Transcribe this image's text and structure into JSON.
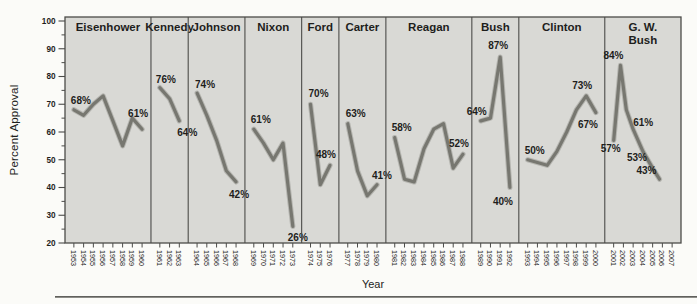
{
  "chart_data": {
    "type": "line",
    "xlabel": "Year",
    "ylabel": "Percent Approval",
    "ylim": [
      20,
      100
    ],
    "y_major_step": 10,
    "y_minor_step": 5,
    "x_range": [
      1953,
      2007
    ],
    "grid": false,
    "legend": "none",
    "line_color": "#74746d",
    "line_halo_color": "#8a8a83",
    "plot_bg": "#d9d9d5",
    "frame_color": "#4c4c49",
    "text_color": "#1e1e1c",
    "panels": [
      {
        "president": "Eisenhower",
        "title_lines": [
          "Eisenhower"
        ],
        "years": [
          1953,
          1960
        ],
        "points": [
          [
            1953,
            68
          ],
          [
            1954,
            66
          ],
          [
            1955,
            70
          ],
          [
            1956,
            73
          ],
          [
            1957,
            64
          ],
          [
            1958,
            55
          ],
          [
            1959,
            65
          ],
          [
            1960,
            61
          ]
        ],
        "callouts": [
          {
            "text": "68%",
            "anchor": [
              1953,
              68
            ],
            "dx": 7,
            "dy": -9
          },
          {
            "text": "61%",
            "anchor": [
              1960,
              61
            ],
            "dx": -4,
            "dy": -15
          }
        ]
      },
      {
        "president": "Kennedy",
        "title_lines": [
          "Kennedy"
        ],
        "years": [
          1961,
          1963
        ],
        "points": [
          [
            1961,
            76
          ],
          [
            1962,
            72
          ],
          [
            1963,
            64
          ]
        ],
        "callouts": [
          {
            "text": "76%",
            "anchor": [
              1961,
              76
            ],
            "dx": 6,
            "dy": -8
          },
          {
            "text": "64%",
            "anchor": [
              1963,
              64
            ],
            "dx": 8,
            "dy": 12
          }
        ]
      },
      {
        "president": "Johnson",
        "title_lines": [
          "Johnson"
        ],
        "years": [
          1964,
          1968
        ],
        "points": [
          [
            1964,
            74
          ],
          [
            1965,
            66
          ],
          [
            1966,
            57
          ],
          [
            1967,
            46
          ],
          [
            1968,
            42
          ]
        ],
        "callouts": [
          {
            "text": "74%",
            "anchor": [
              1964,
              74
            ],
            "dx": 8,
            "dy": -8
          },
          {
            "text": "42%",
            "anchor": [
              1968,
              42
            ],
            "dx": 3,
            "dy": 13
          }
        ]
      },
      {
        "president": "Nixon",
        "title_lines": [
          "Nixon"
        ],
        "years": [
          1969,
          1973
        ],
        "points": [
          [
            1969,
            61
          ],
          [
            1970,
            56
          ],
          [
            1971,
            50
          ],
          [
            1972,
            56
          ],
          [
            1973,
            26
          ]
        ],
        "callouts": [
          {
            "text": "61%",
            "anchor": [
              1969,
              61
            ],
            "dx": 7,
            "dy": -9
          },
          {
            "text": "26%",
            "anchor": [
              1973,
              26
            ],
            "dx": 5,
            "dy": 12
          }
        ]
      },
      {
        "president": "Ford",
        "title_lines": [
          "Ford"
        ],
        "years": [
          1974,
          1976
        ],
        "points": [
          [
            1974,
            70
          ],
          [
            1975,
            41
          ],
          [
            1976,
            48
          ]
        ],
        "callouts": [
          {
            "text": "70%",
            "anchor": [
              1974,
              70
            ],
            "dx": 8,
            "dy": -10
          },
          {
            "text": "48%",
            "anchor": [
              1976,
              48
            ],
            "dx": -4,
            "dy": -10
          }
        ]
      },
      {
        "president": "Carter",
        "title_lines": [
          "Carter"
        ],
        "years": [
          1977,
          1980
        ],
        "points": [
          [
            1977,
            63
          ],
          [
            1978,
            46
          ],
          [
            1979,
            37
          ],
          [
            1980,
            41
          ]
        ],
        "callouts": [
          {
            "text": "63%",
            "anchor": [
              1977,
              63
            ],
            "dx": 8,
            "dy": -10
          },
          {
            "text": "41%",
            "anchor": [
              1980,
              41
            ],
            "dx": 5,
            "dy": -9
          }
        ]
      },
      {
        "president": "Reagan",
        "title_lines": [
          "Reagan"
        ],
        "years": [
          1981,
          1988
        ],
        "points": [
          [
            1981,
            58
          ],
          [
            1982,
            43
          ],
          [
            1983,
            42
          ],
          [
            1984,
            54
          ],
          [
            1985,
            61
          ],
          [
            1986,
            63
          ],
          [
            1987,
            47
          ],
          [
            1988,
            52
          ]
        ],
        "callouts": [
          {
            "text": "58%",
            "anchor": [
              1981,
              58
            ],
            "dx": 7,
            "dy": -10
          },
          {
            "text": "52%",
            "anchor": [
              1988,
              52
            ],
            "dx": -4,
            "dy": -10
          }
        ]
      },
      {
        "president": "Bush",
        "title_lines": [
          "Bush"
        ],
        "years": [
          1989,
          1992
        ],
        "points": [
          [
            1989,
            64
          ],
          [
            1990,
            65
          ],
          [
            1991,
            87
          ],
          [
            1992,
            40
          ]
        ],
        "callouts": [
          {
            "text": "64%",
            "anchor": [
              1989,
              64
            ],
            "dx": -4,
            "dy": -9
          },
          {
            "text": "87%",
            "anchor": [
              1991,
              87
            ],
            "dx": -2,
            "dy": -11
          },
          {
            "text": "40%",
            "anchor": [
              1992,
              40
            ],
            "dx": -7,
            "dy": 14
          }
        ]
      },
      {
        "president": "Clinton",
        "title_lines": [
          "Clinton"
        ],
        "years": [
          1993,
          2000
        ],
        "points": [
          [
            1993,
            50
          ],
          [
            1994,
            49
          ],
          [
            1995,
            48
          ],
          [
            1996,
            53
          ],
          [
            1997,
            60
          ],
          [
            1998,
            68
          ],
          [
            1999,
            73
          ],
          [
            2000,
            67
          ]
        ],
        "callouts": [
          {
            "text": "50%",
            "anchor": [
              1993,
              50
            ],
            "dx": 7,
            "dy": -9
          },
          {
            "text": "73%",
            "anchor": [
              1999,
              73
            ],
            "dx": -4,
            "dy": -10
          },
          {
            "text": "67%",
            "anchor": [
              2000,
              67
            ],
            "dx": -8,
            "dy": 12
          }
        ]
      },
      {
        "president": "G. W. Bush",
        "title_lines": [
          "G. W.",
          "Bush"
        ],
        "years": [
          2001,
          2007
        ],
        "points": [
          [
            2001,
            57
          ],
          [
            2001.7,
            84
          ],
          [
            2002.3,
            68
          ],
          [
            2003,
            61
          ],
          [
            2004,
            53
          ],
          [
            2005,
            47
          ],
          [
            2005.7,
            43
          ]
        ],
        "callouts": [
          {
            "text": "84%",
            "anchor": [
              2001.7,
              84
            ],
            "dx": -7,
            "dy": -9
          },
          {
            "text": "57%",
            "anchor": [
              2001,
              57
            ],
            "dx": -3,
            "dy": 9
          },
          {
            "text": "61%",
            "anchor": [
              2003,
              61
            ],
            "dx": 10,
            "dy": -6
          },
          {
            "text": "53%",
            "anchor": [
              2004,
              53
            ],
            "dx": -6,
            "dy": 7
          },
          {
            "text": "43%",
            "anchor": [
              2005.7,
              43
            ],
            "dx": -13,
            "dy": -8
          }
        ]
      }
    ]
  }
}
